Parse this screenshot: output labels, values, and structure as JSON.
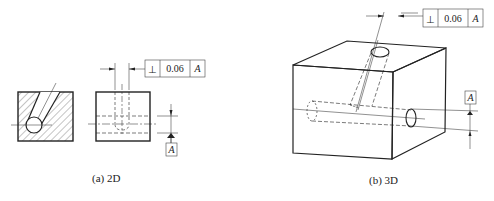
{
  "figure_2d": {
    "caption": "(a) 2D",
    "tolerance_frame": {
      "symbol": "⊥",
      "symbol_name": "perpendicularity-icon",
      "value": "0.06",
      "datum": "A"
    },
    "datum_label": "A"
  },
  "figure_3d": {
    "caption": "(b) 3D",
    "tolerance_frame": {
      "symbol": "⊥",
      "symbol_name": "perpendicularity-icon",
      "value": "0.06",
      "datum": "A"
    },
    "datum_label": "A"
  },
  "colors": {
    "line": "#222222",
    "background": "#ffffff"
  }
}
